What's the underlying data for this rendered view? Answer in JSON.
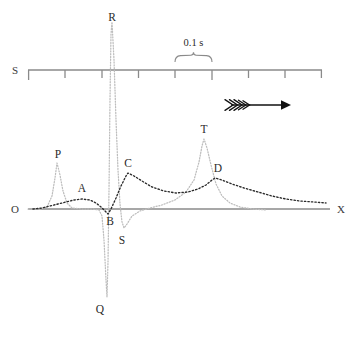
{
  "figure": {
    "type": "ecg-waveform-diagram",
    "background_color": "#ffffff",
    "trace_gray_color": "#bdbdbd",
    "trace_black_color": "#2a2a2a",
    "axis_color": "#8a8a8a"
  },
  "axes": {
    "origin_label": "O",
    "right_label": "X",
    "baseline_y": 209,
    "baseline_x_start": 28,
    "baseline_x_end": 330
  },
  "scale": {
    "label": "S",
    "duration_label": "0.1 s",
    "tick_count": 8,
    "line_y": 70,
    "x_start": 28,
    "x_end": 322,
    "brace_x_start": 175,
    "brace_x_end": 212
  },
  "direction_marker": {
    "name": "right-arrow",
    "x": 225,
    "y": 105,
    "fletch_count": 5
  },
  "wave_labels": {
    "p": "P",
    "q": "Q",
    "r": "R",
    "s": "S",
    "t": "T",
    "a": "A",
    "b": "B",
    "c": "C",
    "d": "D"
  },
  "chart_data": {
    "type": "line",
    "title": "",
    "xlabel": "",
    "ylabel": "",
    "grid": false,
    "legend": "none",
    "annotations": [
      "O",
      "X",
      "S",
      "0.1 s",
      "P",
      "Q",
      "R",
      "S",
      "T",
      "A",
      "B",
      "C",
      "D"
    ],
    "series": [
      {
        "name": "ecg-gray-trace",
        "style": "dotted-gray",
        "points": [
          [
            28,
            209
          ],
          [
            40,
            209
          ],
          [
            47,
            207
          ],
          [
            52,
            196
          ],
          [
            55,
            178
          ],
          [
            57,
            163
          ],
          [
            60,
            175
          ],
          [
            63,
            191
          ],
          [
            67,
            203
          ],
          [
            72,
            208
          ],
          [
            82,
            209
          ],
          [
            92,
            209
          ],
          [
            99,
            210
          ],
          [
            102,
            216
          ],
          [
            104,
            240
          ],
          [
            106,
            280
          ],
          [
            107,
            297
          ],
          [
            108,
            262
          ],
          [
            109,
            190
          ],
          [
            110,
            100
          ],
          [
            111,
            34
          ],
          [
            112,
            22
          ],
          [
            114,
            60
          ],
          [
            116,
            120
          ],
          [
            118,
            170
          ],
          [
            120,
            204
          ],
          [
            122,
            222
          ],
          [
            124,
            228
          ],
          [
            127,
            224
          ],
          [
            132,
            216
          ],
          [
            140,
            211
          ],
          [
            150,
            208
          ],
          [
            162,
            205
          ],
          [
            175,
            200
          ],
          [
            186,
            192
          ],
          [
            194,
            180
          ],
          [
            199,
            162
          ],
          [
            202,
            146
          ],
          [
            204,
            139
          ],
          [
            207,
            148
          ],
          [
            211,
            165
          ],
          [
            216,
            184
          ],
          [
            222,
            196
          ],
          [
            230,
            203
          ],
          [
            240,
            207
          ],
          [
            252,
            209
          ],
          [
            266,
            210
          ]
        ]
      },
      {
        "name": "mechanical-black-trace",
        "style": "dotted-black",
        "points": [
          [
            33,
            209
          ],
          [
            42,
            208
          ],
          [
            50,
            206
          ],
          [
            58,
            204
          ],
          [
            66,
            202
          ],
          [
            74,
            200
          ],
          [
            82,
            199
          ],
          [
            90,
            200
          ],
          [
            96,
            203
          ],
          [
            101,
            207
          ],
          [
            105,
            211
          ],
          [
            108,
            214
          ],
          [
            111,
            209
          ],
          [
            116,
            198
          ],
          [
            121,
            186
          ],
          [
            126,
            176
          ],
          [
            128,
            173
          ],
          [
            134,
            176
          ],
          [
            142,
            181
          ],
          [
            152,
            187
          ],
          [
            164,
            191
          ],
          [
            176,
            193
          ],
          [
            188,
            192
          ],
          [
            198,
            189
          ],
          [
            206,
            185
          ],
          [
            212,
            180
          ],
          [
            215,
            178
          ],
          [
            222,
            180
          ],
          [
            232,
            184
          ],
          [
            244,
            188
          ],
          [
            258,
            192
          ],
          [
            272,
            196
          ],
          [
            286,
            199
          ],
          [
            300,
            201
          ],
          [
            314,
            202
          ],
          [
            326,
            203
          ]
        ]
      }
    ]
  }
}
